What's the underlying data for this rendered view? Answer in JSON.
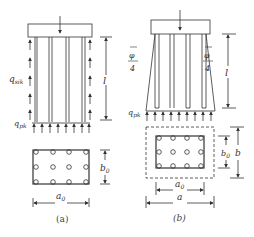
{
  "figure": {
    "panel_a": {
      "caption": "(a)",
      "labels": {
        "side_friction": "q",
        "side_friction_sub": "sik",
        "end_bearing": "q",
        "end_bearing_sub": "pk",
        "length": "l",
        "width": "b",
        "width_sub": "0",
        "length_plan": "a",
        "length_plan_sub": "0"
      },
      "pile_grid": {
        "rows": 3,
        "cols": 4
      }
    },
    "panel_b": {
      "caption": "(b)",
      "labels": {
        "spread_angle_left": "φ",
        "spread_angle_left_den": "4",
        "spread_angle_right": "φ",
        "spread_angle_right_den": "4",
        "end_bearing": "q",
        "end_bearing_sub": "pk",
        "length": "l",
        "inner_width": "b",
        "inner_width_sub": "0",
        "outer_width": "b",
        "inner_length": "a",
        "inner_length_sub": "0",
        "outer_length": "a"
      },
      "pile_grid": {
        "rows": 3,
        "cols": 4
      }
    },
    "colors": {
      "line": "#333333",
      "background": "#ffffff"
    }
  }
}
